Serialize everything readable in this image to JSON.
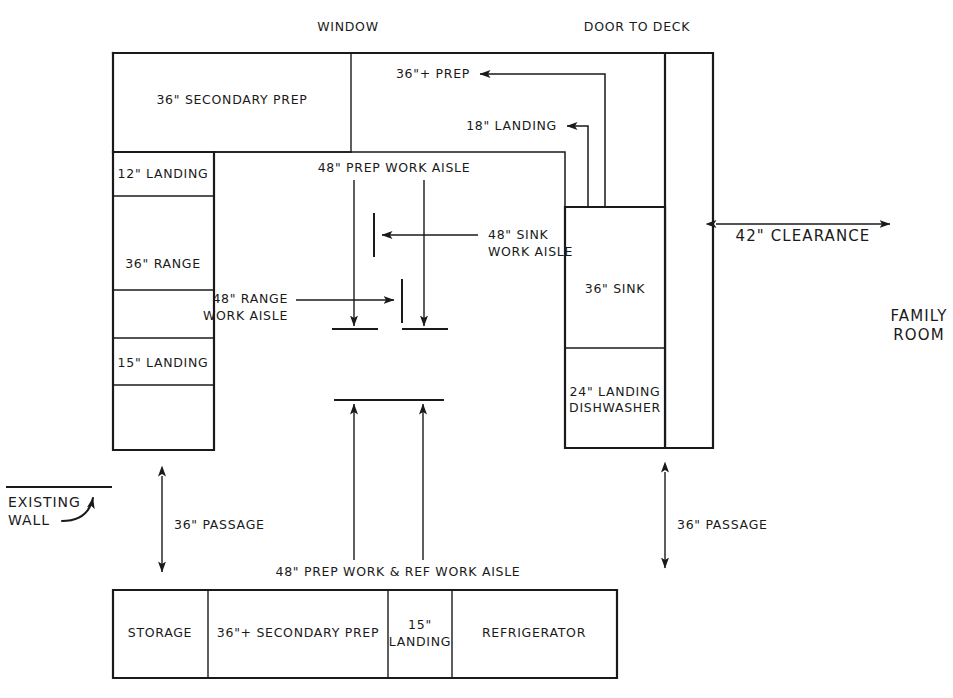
{
  "annotations": {
    "window": "WINDOW",
    "door_to_deck": "DOOR TO DECK",
    "clearance": "42\" CLEARANCE",
    "family_room_line1": "FAMILY",
    "family_room_line2": "ROOM",
    "existing_wall_line1": "EXISTING",
    "existing_wall_line2": "WALL"
  },
  "cabinets": {
    "top_run": [
      {
        "id": "secondary-prep",
        "label": "36\" SECONDARY PREP"
      }
    ],
    "left_run": [
      {
        "id": "landing-12",
        "label": "12\" LANDING"
      },
      {
        "id": "range-36",
        "label": "36\" RANGE"
      },
      {
        "id": "landing-15",
        "label": "15\" LANDING"
      },
      {
        "id": "blank-left",
        "label": ""
      }
    ],
    "right_run": [
      {
        "id": "sink-36",
        "label": "36\" SINK"
      },
      {
        "id": "landing-dishwasher",
        "label_line1": "24\" LANDING",
        "label_line2": "DISHWASHER"
      }
    ],
    "bottom_run": [
      {
        "id": "storage",
        "label": "STORAGE"
      },
      {
        "id": "secondary-prep-bottom",
        "label": "36\"+ SECONDARY PREP"
      },
      {
        "id": "landing-15-bottom",
        "label_line1": "15\"",
        "label_line2": "LANDING"
      },
      {
        "id": "refrigerator",
        "label": "REFRIGERATOR"
      }
    ]
  },
  "dimensions": [
    {
      "id": "prep-36-plus",
      "label": "36\"+ PREP"
    },
    {
      "id": "landing-18",
      "label": "18\" LANDING"
    },
    {
      "id": "prep-work-aisle",
      "label": "48\" PREP WORK AISLE"
    },
    {
      "id": "sink-work-aisle",
      "label_line1": "48\" SINK",
      "label_line2": "WORK AISLE"
    },
    {
      "id": "range-work-aisle",
      "label_line1": "48\" RANGE",
      "label_line2": "WORK AISLE"
    },
    {
      "id": "passage-left",
      "label": "36\" PASSAGE"
    },
    {
      "id": "passage-right",
      "label": "36\" PASSAGE"
    },
    {
      "id": "prep-ref-work-aisle",
      "label": "48\" PREP WORK & REF WORK AISLE"
    }
  ],
  "colors": {
    "ink": "#1a1a1a",
    "paper": "#ffffff"
  }
}
